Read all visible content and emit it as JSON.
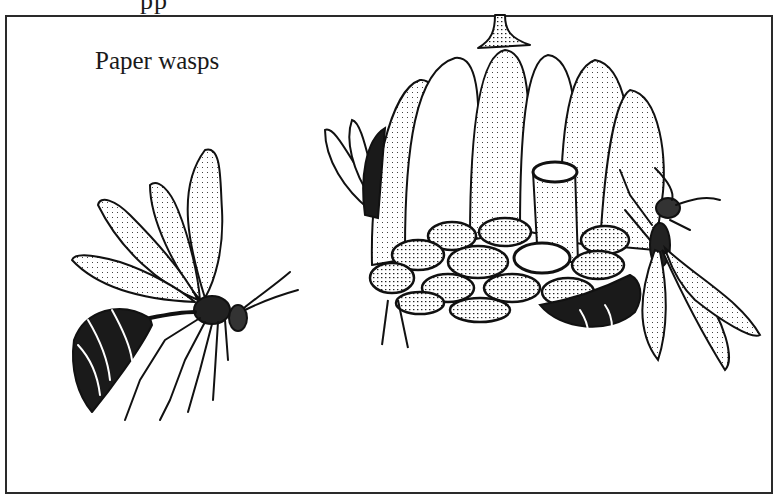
{
  "figure": {
    "top_cut_text": "pp",
    "caption": "Paper wasps",
    "ink_color": "#1a1a1a",
    "paper_color": "#ffffff"
  },
  "illustrations": [
    {
      "name": "flying-wasp",
      "description": "paper wasp in flight facing right, wings raised"
    },
    {
      "name": "paper-nest",
      "description": "hanging umbrella-shaped paper nest with stalk and open hexagonal cells"
    },
    {
      "name": "wasp-on-nest-left",
      "description": "wasp partially hidden behind left side of nest"
    },
    {
      "name": "wasp-on-nest-right",
      "description": "wasp clinging to right side of nest, wings down"
    }
  ]
}
